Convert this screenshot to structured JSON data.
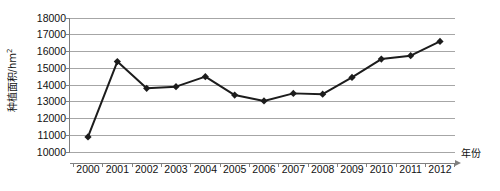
{
  "chart_data": {
    "type": "line",
    "title": "",
    "xlabel": "年份",
    "ylabel": "种植面积/hm2",
    "ylabel_base": "种植面积/hm",
    "ylabel_sup": "2",
    "categories": [
      "2000",
      "2001",
      "2002",
      "2003",
      "2004",
      "2005",
      "2006",
      "2007",
      "2008",
      "2009",
      "2010",
      "2011",
      "2012"
    ],
    "x": [
      2000,
      2001,
      2002,
      2003,
      2004,
      2005,
      2006,
      2007,
      2008,
      2009,
      2010,
      2011,
      2012
    ],
    "values": [
      10900,
      15400,
      13800,
      13900,
      14500,
      13400,
      13050,
      13500,
      13450,
      14450,
      15550,
      15750,
      16600
    ],
    "series": [
      {
        "name": "种植面积",
        "values": [
          10900,
          15400,
          13800,
          13900,
          14500,
          13400,
          13050,
          13500,
          13450,
          14450,
          15550,
          15750,
          16600
        ]
      }
    ],
    "ylim": [
      10000,
      18000
    ],
    "ytick_step": 1000,
    "yticks": [
      10000,
      11000,
      12000,
      13000,
      14000,
      15000,
      16000,
      17000,
      18000
    ],
    "ytick_labels": [
      "10000",
      "11000",
      "12000",
      "13000",
      "14000",
      "15000",
      "16000",
      "17000",
      "18000"
    ],
    "xticks": [
      "2000",
      "2001",
      "2002",
      "2003",
      "2004",
      "2005",
      "2006",
      "2007",
      "2008",
      "2009",
      "2010",
      "2011",
      "2012"
    ],
    "grid": "horizontal",
    "legend": "none",
    "marker": "diamond",
    "line_color": "#1c1c1c",
    "marker_color": "#1c1c1c",
    "grid_color": "#a6a6a6",
    "axis_color": "#808080",
    "background_color": "#ffffff",
    "x_axis_arrow": true
  }
}
